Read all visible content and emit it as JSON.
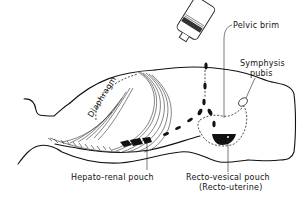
{
  "figure": {
    "type": "anatomical-diagram",
    "labels": {
      "pelvic_brim": "Pelvic brim",
      "symphysis_line1": "Symphysis",
      "symphysis_line2": "pubis",
      "diaphragm": "Diaphragm",
      "hepato_renal": "Hepato-renal pouch",
      "recto_vesical_line1": "Recto-vesical pouch",
      "recto_vesical_line2": "(Recto-uterine)"
    },
    "colors": {
      "ink": "#111111",
      "background": "#ffffff"
    }
  }
}
